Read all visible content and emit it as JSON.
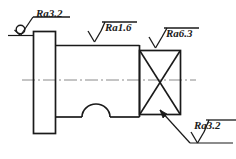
{
  "drawing": {
    "type": "engineering-drawing",
    "subject": "stepped-shaft-surface-roughness",
    "background_color": "#ffffff",
    "line_color": "#1a1a1a",
    "centerline_color": "#808080"
  },
  "annotations": {
    "collective_top_left": {
      "label": "Ra3.2",
      "symbol": "surface-finish-check-with-circle",
      "meaning": "all-surfaces"
    },
    "top_middle": {
      "label": "Ra1.6",
      "symbol": "surface-finish-triangle"
    },
    "top_right": {
      "label": "Ra6.3",
      "symbol": "surface-finish-triangle"
    },
    "bottom_right": {
      "label": "Ra3.2",
      "symbol": "surface-finish-triangle-with-leader"
    }
  },
  "geometry": {
    "flange": {
      "x": 33,
      "y": 31,
      "width": 22,
      "height": 103
    },
    "shaft": {
      "x": 55,
      "y": 45,
      "width": 84,
      "height": 72
    },
    "square_section": {
      "x": 139,
      "y": 50,
      "width": 41,
      "height": 65,
      "marking": "diagonal-cross"
    },
    "groove_arc": {
      "start_x": 82,
      "end_x": 110,
      "base_y": 117,
      "peak_y": 106
    },
    "centerline": {
      "x1": 22,
      "x2": 196,
      "y": 80
    }
  }
}
